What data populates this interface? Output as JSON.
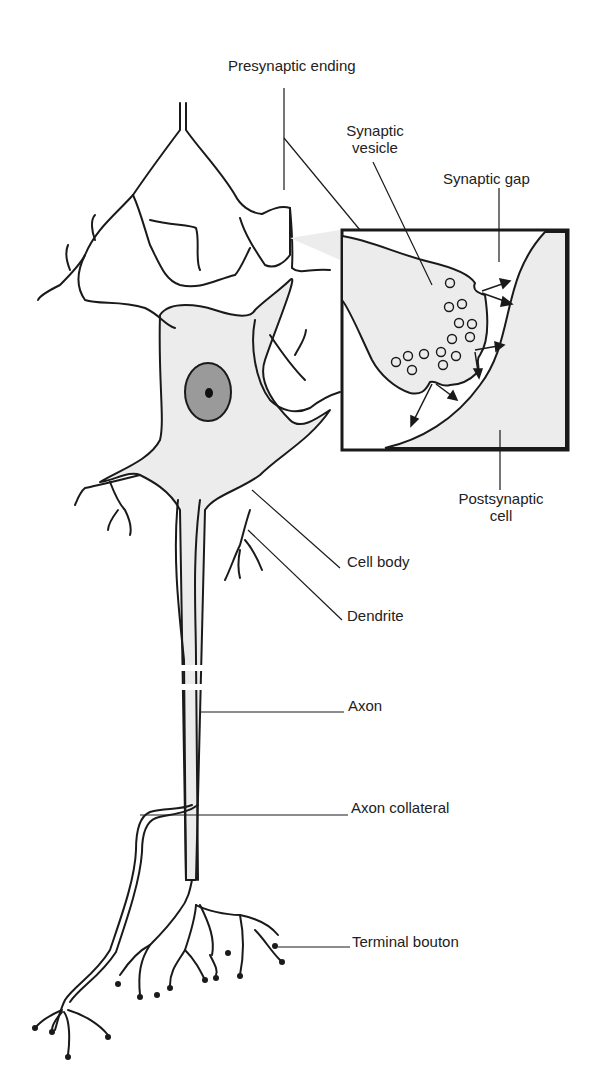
{
  "diagram": {
    "labels": {
      "presynaptic_ending": "Presynaptic ending",
      "synaptic_vesicle_line1": "Synaptic",
      "synaptic_vesicle_line2": "vesicle",
      "synaptic_gap": "Synaptic gap",
      "postsynaptic_cell_line1": "Postsynaptic",
      "postsynaptic_cell_line2": "cell",
      "cell_body": "Cell body",
      "dendrite": "Dendrite",
      "axon": "Axon",
      "axon_collateral": "Axon collateral",
      "terminal_bouton": "Terminal bouton"
    },
    "colors": {
      "line": "#1a1a1a",
      "cell_fill": "#ececec",
      "nucleus_fill": "#9a9a9a",
      "nucleolus_fill": "#111111",
      "background": "#ffffff"
    }
  }
}
